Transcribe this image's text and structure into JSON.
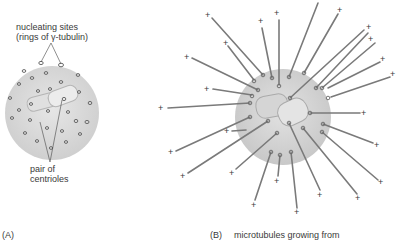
{
  "panel_a": {
    "tag": "(A)",
    "label_nucleating_line1": "nucleating sites",
    "label_nucleating_line2": "(rings of γ-tubulin)",
    "label_centrioles_line1": "pair of",
    "label_centrioles_line2": "centrioles"
  },
  "panel_b": {
    "tag": "(B)",
    "caption": "microtubules growing from",
    "plus_symbol": "+"
  },
  "colors": {
    "centrosome_fill": "#d8d8d8",
    "microtubule": "#7a7a7a",
    "ring": "#6a6a6a",
    "text": "#3a3a3a"
  }
}
